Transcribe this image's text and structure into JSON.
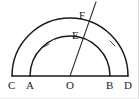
{
  "figure": {
    "background_color": "#ffffff",
    "stroke_color": "#1a1a1a",
    "label_color": "#1a1a1a",
    "width": 139,
    "height": 99,
    "baseline": {
      "y": 76,
      "x_start": 12,
      "x_end": 128
    },
    "center": {
      "name": "O",
      "x": 70,
      "y": 76
    },
    "arcs": [
      {
        "name": "outer-semicircle",
        "radius": 58,
        "left_endpoint": "C",
        "right_endpoint": "D",
        "tick_side": "right"
      },
      {
        "name": "inner-semicircle",
        "radius": 40,
        "left_endpoint": "A",
        "right_endpoint": "B",
        "tick_side": "left"
      }
    ],
    "ray": {
      "name": "radial-ray-OF",
      "from": "O",
      "through": [
        "E",
        "F"
      ],
      "angle_degrees": 68,
      "end_x": 96,
      "end_y": 2
    },
    "points": [
      {
        "id": "C",
        "label": "C",
        "x": 12,
        "y": 76,
        "label_x": 8,
        "label_y": 80,
        "on": "baseline"
      },
      {
        "id": "A",
        "label": "A",
        "x": 30,
        "y": 76,
        "label_x": 26,
        "label_y": 80,
        "on": "baseline"
      },
      {
        "id": "O",
        "label": "O",
        "x": 70,
        "y": 76,
        "label_x": 66,
        "label_y": 80,
        "on": "baseline"
      },
      {
        "id": "B",
        "label": "B",
        "x": 110,
        "y": 76,
        "label_x": 106,
        "label_y": 80,
        "on": "baseline"
      },
      {
        "id": "D",
        "label": "D",
        "x": 128,
        "y": 76,
        "label_x": 124,
        "label_y": 80,
        "on": "baseline"
      },
      {
        "id": "E",
        "label": "E",
        "x": 85,
        "y": 39,
        "label_x": 72,
        "label_y": 30,
        "on": "inner-semicircle"
      },
      {
        "id": "F",
        "label": "F",
        "x": 92,
        "y": 22,
        "label_x": 79,
        "label_y": 10,
        "on": "outer-semicircle"
      }
    ]
  }
}
